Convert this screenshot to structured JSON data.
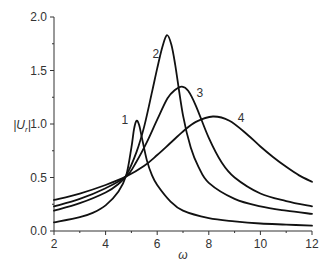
{
  "chart_data": {
    "type": "line",
    "title": "",
    "xlabel": "ω",
    "ylabel": "|U_r|",
    "ylabel_main": "|U",
    "ylabel_sub": "r",
    "ylabel_end": "|",
    "xlim": [
      2,
      12
    ],
    "ylim": [
      0.0,
      2.0
    ],
    "x_ticks": [
      2,
      4,
      6,
      8,
      10,
      12
    ],
    "x_tick_labels": [
      "2",
      "4",
      "6",
      "8",
      "10",
      "12"
    ],
    "x_minor_ticks": [
      3,
      5,
      7,
      9,
      11
    ],
    "y_ticks": [
      0.0,
      0.5,
      1.0,
      1.5,
      2.0
    ],
    "y_tick_labels": [
      "0.0",
      "0.5",
      "1.0",
      "1.5",
      "2.0"
    ],
    "y_minor_ticks": [
      0.25,
      0.75,
      1.25,
      1.75
    ],
    "grid": false,
    "legend": "none (curves labeled inline 1–4)",
    "series": [
      {
        "name": "1",
        "label_pos": [
          4.75,
          1.0
        ],
        "x": [
          2,
          3,
          3.5,
          4,
          4.5,
          4.8,
          5.0,
          5.1,
          5.2,
          5.3,
          5.4,
          5.6,
          5.8,
          6.0,
          6.5,
          7,
          8,
          9,
          10,
          11,
          12
        ],
        "y": [
          0.08,
          0.13,
          0.17,
          0.24,
          0.37,
          0.52,
          0.78,
          0.95,
          1.03,
          0.99,
          0.88,
          0.66,
          0.52,
          0.43,
          0.28,
          0.19,
          0.12,
          0.09,
          0.07,
          0.06,
          0.05
        ]
      },
      {
        "name": "2",
        "label_pos": [
          5.95,
          1.62
        ],
        "x": [
          2,
          3,
          4,
          4.5,
          4.8,
          5.2,
          5.5,
          5.8,
          6.0,
          6.2,
          6.38,
          6.55,
          6.7,
          7.0,
          7.3,
          7.6,
          8,
          9,
          10,
          11,
          12
        ],
        "y": [
          0.19,
          0.26,
          0.36,
          0.44,
          0.52,
          0.74,
          0.98,
          1.3,
          1.52,
          1.72,
          1.83,
          1.74,
          1.55,
          1.08,
          0.78,
          0.6,
          0.45,
          0.3,
          0.23,
          0.19,
          0.16
        ]
      },
      {
        "name": "3",
        "label_pos": [
          7.65,
          1.25
        ],
        "x": [
          2,
          3,
          4,
          4.8,
          5.2,
          5.6,
          6.0,
          6.4,
          6.7,
          6.96,
          7.2,
          7.5,
          8.0,
          8.5,
          9,
          10,
          11,
          12
        ],
        "y": [
          0.23,
          0.3,
          0.4,
          0.51,
          0.65,
          0.83,
          1.04,
          1.24,
          1.32,
          1.35,
          1.31,
          1.17,
          0.87,
          0.64,
          0.5,
          0.35,
          0.28,
          0.23
        ]
      },
      {
        "name": "4",
        "label_pos": [
          9.25,
          1.02
        ],
        "x": [
          2,
          3,
          4,
          4.8,
          5.5,
          6.0,
          6.5,
          7.0,
          7.5,
          8.16,
          8.8,
          9.5,
          10,
          10.5,
          11,
          11.5,
          12
        ],
        "y": [
          0.29,
          0.35,
          0.43,
          0.51,
          0.61,
          0.71,
          0.82,
          0.93,
          1.02,
          1.07,
          1.03,
          0.9,
          0.79,
          0.69,
          0.6,
          0.52,
          0.46
        ]
      }
    ]
  }
}
